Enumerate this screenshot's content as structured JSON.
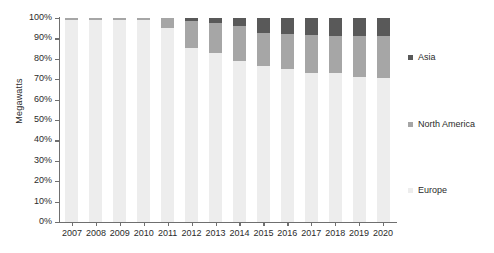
{
  "chart_data": {
    "type": "bar",
    "subtype": "stacked-percentage-column",
    "title": "",
    "xlabel": "",
    "ylabel": "Megawatts",
    "ylim": [
      0,
      100
    ],
    "y_tick_labels": [
      "100%",
      "90%",
      "80%",
      "70%",
      "60%",
      "50%",
      "40%",
      "30%",
      "20%",
      "10%",
      "0%"
    ],
    "y_tick_values": [
      100,
      90,
      80,
      70,
      60,
      50,
      40,
      30,
      20,
      10,
      0
    ],
    "grid": false,
    "legend_position": "right",
    "categories": [
      "2007",
      "2008",
      "2009",
      "2010",
      "2011",
      "2012",
      "2013",
      "2014",
      "2015",
      "2016",
      "2017",
      "2018",
      "2019",
      "2020"
    ],
    "series": [
      {
        "name": "Europe",
        "color": "#ededed",
        "values": [
          99.0,
          99.0,
          99.0,
          99.0,
          95.0,
          85.5,
          83.0,
          79.0,
          76.5,
          75.0,
          73.0,
          73.0,
          71.0,
          70.5
        ]
      },
      {
        "name": "North America",
        "color": "#a6a6a6",
        "values": [
          1.0,
          1.0,
          1.0,
          1.0,
          5.0,
          13.0,
          14.5,
          17.0,
          16.0,
          17.0,
          18.5,
          18.0,
          20.0,
          20.5
        ]
      },
      {
        "name": "Asia",
        "color": "#595959",
        "values": [
          0.0,
          0.0,
          0.0,
          0.0,
          0.0,
          1.5,
          2.5,
          4.0,
          7.5,
          8.0,
          8.5,
          9.0,
          9.0,
          9.0
        ]
      }
    ],
    "legend_entries": [
      {
        "label": "Asia",
        "color": "#595959"
      },
      {
        "label": "North America",
        "color": "#a6a6a6"
      },
      {
        "label": "Europe",
        "color": "#ededed"
      }
    ],
    "axis_color": "#6f6f6f"
  }
}
